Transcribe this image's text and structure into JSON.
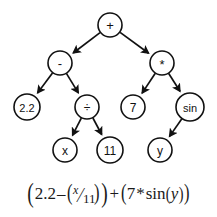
{
  "diagram": {
    "colors": {
      "stroke": "#111111",
      "node_fill": "#ffffff",
      "background": "#ffffff",
      "text": "#111111"
    },
    "nodes": [
      {
        "id": "root",
        "label": "+",
        "kind": "operator",
        "cx": 110,
        "cy": 25,
        "r": 12,
        "font_size": 13
      },
      {
        "id": "minus",
        "label": "-",
        "kind": "operator",
        "cx": 60,
        "cy": 63,
        "r": 12,
        "font_size": 13
      },
      {
        "id": "times",
        "label": "*",
        "kind": "operator",
        "cx": 162,
        "cy": 63,
        "r": 12,
        "font_size": 13
      },
      {
        "id": "const22",
        "label": "2.2",
        "kind": "constant",
        "cx": 27,
        "cy": 107,
        "r": 13,
        "font_size": 11
      },
      {
        "id": "divide",
        "label": "÷",
        "kind": "operator",
        "cx": 87,
        "cy": 107,
        "r": 12,
        "font_size": 12
      },
      {
        "id": "const7",
        "label": "7",
        "kind": "constant",
        "cx": 133,
        "cy": 107,
        "r": 12,
        "font_size": 12
      },
      {
        "id": "sin",
        "label": "sin",
        "kind": "function",
        "cx": 190,
        "cy": 107,
        "r": 14,
        "font_size": 11
      },
      {
        "id": "varx",
        "label": "x",
        "kind": "variable",
        "cx": 65,
        "cy": 150,
        "r": 12,
        "font_size": 12
      },
      {
        "id": "const11",
        "label": "11",
        "kind": "constant",
        "cx": 110,
        "cy": 150,
        "r": 13,
        "font_size": 12
      },
      {
        "id": "vary",
        "label": "y",
        "kind": "variable",
        "cx": 160,
        "cy": 150,
        "r": 12,
        "font_size": 12
      }
    ],
    "edges": [
      {
        "from": "root",
        "to": "minus"
      },
      {
        "from": "root",
        "to": "times"
      },
      {
        "from": "minus",
        "to": "const22"
      },
      {
        "from": "minus",
        "to": "divide"
      },
      {
        "from": "times",
        "to": "const7"
      },
      {
        "from": "times",
        "to": "sin"
      },
      {
        "from": "divide",
        "to": "varx"
      },
      {
        "from": "divide",
        "to": "const11"
      },
      {
        "from": "sin",
        "to": "vary"
      }
    ]
  },
  "formula": {
    "full_text": "(2.2 - (x/11)) + (7 * sin(y))",
    "open_outer_left": "(",
    "const_22": "2.2",
    "minus_op": "–",
    "open_frac_paren": "(",
    "frac_numerator": "x",
    "frac_slash": "⁄",
    "frac_denominator": "11",
    "close_frac_paren": ")",
    "close_outer_left": ")",
    "plus_op": "+",
    "open_outer_right": "(",
    "const_7": "7",
    "times_op": "*",
    "fn_sin": "sin",
    "open_arg_paren": "(",
    "arg_y": "y",
    "close_arg_paren": ")",
    "close_outer_right": ")"
  }
}
